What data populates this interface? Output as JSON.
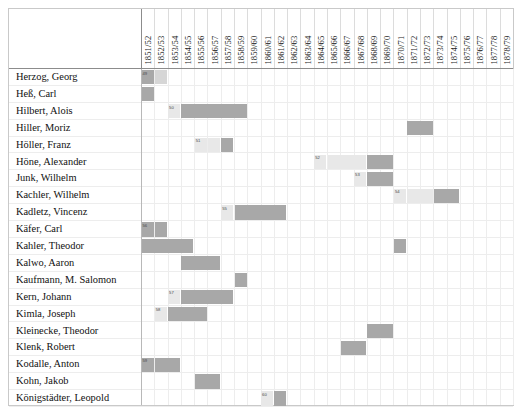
{
  "chart_data": {
    "type": "heatmap",
    "title": "",
    "xlabel": "",
    "ylabel": "",
    "legend": "",
    "grid": true,
    "categories": [
      "1851/52",
      "1852/53",
      "1853/54",
      "1854/55",
      "1855/56",
      "1856/57",
      "1857/58",
      "1858/59",
      "1859/60",
      "1860/61",
      "1861/62",
      "1862/63",
      "1863/64",
      "1864/65",
      "1865/66",
      "1866/67",
      "1867/68",
      "1868/69",
      "1869/70",
      "1870/71",
      "1871/72",
      "1872/73",
      "1873/74",
      "1874/75",
      "1875/76",
      "1876/77",
      "1877/78",
      "1878/79"
    ],
    "rows": [
      "Herzog, Georg",
      "Heß, Carl",
      "Hilbert, Alois",
      "Hiller, Moriz",
      "Höller, Franz",
      "Höne, Alexander",
      "Junk, Wilhelm",
      "Kachler, Wilhelm",
      "Kadletz, Vincenz",
      "Käfer, Carl",
      "Kahler, Theodor",
      "Kalwo, Aaron",
      "Kaufmann, M. Salomon",
      "Kern, Johann",
      "Kimla, Joseph",
      "Kleinecke, Theodor",
      "Klenk, Robert",
      "Kodalle, Anton",
      "Kohn, Jakob",
      "Königstädter, Leopold"
    ],
    "cells": [
      {
        "row": 0,
        "col": 0,
        "span": 1,
        "shade": "dark",
        "label": "49"
      },
      {
        "row": 0,
        "col": 1,
        "span": 1,
        "shade": "mid",
        "label": ""
      },
      {
        "row": 1,
        "col": 0,
        "span": 1,
        "shade": "dark",
        "label": ""
      },
      {
        "row": 2,
        "col": 2,
        "span": 1,
        "shade": "light",
        "label": "50"
      },
      {
        "row": 2,
        "col": 3,
        "span": 5,
        "shade": "dark",
        "label": ""
      },
      {
        "row": 3,
        "col": 20,
        "span": 2,
        "shade": "dark",
        "label": ""
      },
      {
        "row": 4,
        "col": 4,
        "span": 1,
        "shade": "light",
        "label": "51"
      },
      {
        "row": 4,
        "col": 5,
        "span": 1,
        "shade": "light",
        "label": ""
      },
      {
        "row": 4,
        "col": 6,
        "span": 1,
        "shade": "dark",
        "label": ""
      },
      {
        "row": 5,
        "col": 13,
        "span": 1,
        "shade": "light",
        "label": "52"
      },
      {
        "row": 5,
        "col": 14,
        "span": 3,
        "shade": "light",
        "label": ""
      },
      {
        "row": 5,
        "col": 17,
        "span": 2,
        "shade": "dark",
        "label": ""
      },
      {
        "row": 6,
        "col": 16,
        "span": 1,
        "shade": "light",
        "label": "53"
      },
      {
        "row": 6,
        "col": 17,
        "span": 2,
        "shade": "dark",
        "label": ""
      },
      {
        "row": 7,
        "col": 19,
        "span": 1,
        "shade": "light",
        "label": "54"
      },
      {
        "row": 7,
        "col": 20,
        "span": 2,
        "shade": "light",
        "label": ""
      },
      {
        "row": 7,
        "col": 22,
        "span": 2,
        "shade": "dark",
        "label": ""
      },
      {
        "row": 8,
        "col": 6,
        "span": 1,
        "shade": "light",
        "label": "55"
      },
      {
        "row": 8,
        "col": 7,
        "span": 4,
        "shade": "dark",
        "label": ""
      },
      {
        "row": 9,
        "col": 0,
        "span": 1,
        "shade": "dark",
        "label": "56"
      },
      {
        "row": 9,
        "col": 1,
        "span": 1,
        "shade": "dark",
        "label": ""
      },
      {
        "row": 10,
        "col": 0,
        "span": 4,
        "shade": "dark",
        "label": ""
      },
      {
        "row": 10,
        "col": 19,
        "span": 1,
        "shade": "dark",
        "label": ""
      },
      {
        "row": 11,
        "col": 3,
        "span": 3,
        "shade": "dark",
        "label": ""
      },
      {
        "row": 12,
        "col": 7,
        "span": 1,
        "shade": "dark",
        "label": ""
      },
      {
        "row": 13,
        "col": 2,
        "span": 1,
        "shade": "light",
        "label": "57"
      },
      {
        "row": 13,
        "col": 3,
        "span": 4,
        "shade": "dark",
        "label": ""
      },
      {
        "row": 14,
        "col": 1,
        "span": 1,
        "shade": "light",
        "label": "58"
      },
      {
        "row": 14,
        "col": 2,
        "span": 3,
        "shade": "dark",
        "label": ""
      },
      {
        "row": 15,
        "col": 17,
        "span": 2,
        "shade": "dark",
        "label": ""
      },
      {
        "row": 16,
        "col": 15,
        "span": 2,
        "shade": "dark",
        "label": ""
      },
      {
        "row": 17,
        "col": 0,
        "span": 1,
        "shade": "dark",
        "label": "59"
      },
      {
        "row": 17,
        "col": 1,
        "span": 2,
        "shade": "dark",
        "label": ""
      },
      {
        "row": 18,
        "col": 4,
        "span": 2,
        "shade": "dark",
        "label": ""
      },
      {
        "row": 19,
        "col": 9,
        "span": 1,
        "shade": "light",
        "label": "60"
      },
      {
        "row": 19,
        "col": 10,
        "span": 1,
        "shade": "dark",
        "label": ""
      }
    ],
    "colors": {
      "dark": "#a8a8a8",
      "mid": "#d6d6d6",
      "light": "#e8e8e8",
      "grid": "#ededed",
      "frame": "#c9c9c9",
      "text": "#1a1a1a"
    }
  }
}
